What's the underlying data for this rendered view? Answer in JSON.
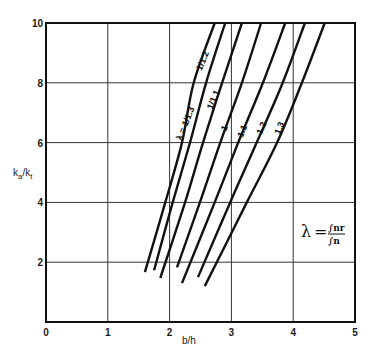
{
  "chart_data": {
    "type": "line",
    "title": "",
    "xlabel": "b/h",
    "ylabel": "k_a/k_t",
    "xlim": [
      0,
      5
    ],
    "ylim": [
      0,
      10
    ],
    "x_ticks": [
      "0",
      "1",
      "2",
      "3",
      "4",
      "5"
    ],
    "y_ticks": [
      "2",
      "4",
      "6",
      "8",
      "10"
    ],
    "grid": true,
    "legend_position": "none (inline curve labels)",
    "annotation": {
      "lambda_symbol": "λ",
      "equals": "=",
      "numerator": "∫nr",
      "denominator": "∫n",
      "text": "λ = ∫nr / ∫n"
    },
    "series": [
      {
        "name": "λ = 1/1.3",
        "label": "λ = 1/1.3",
        "x": [
          1.6,
          1.93,
          2.2,
          2.39,
          2.73
        ],
        "y": [
          1.67,
          4.0,
          6.0,
          8.0,
          10.0
        ]
      },
      {
        "name": "1/1.2",
        "label": "1/1.2",
        "x": [
          1.75,
          2.05,
          2.33,
          2.59,
          2.9
        ],
        "y": [
          1.73,
          4.0,
          6.0,
          8.0,
          10.0
        ]
      },
      {
        "name": "1/1.1",
        "label": "1/1.1",
        "x": [
          1.85,
          2.25,
          2.54,
          2.85,
          3.17
        ],
        "y": [
          1.47,
          4.0,
          6.0,
          8.0,
          10.0
        ]
      },
      {
        "name": "1",
        "label": "1",
        "x": [
          2.12,
          2.49,
          2.82,
          3.17,
          3.48
        ],
        "y": [
          1.83,
          4.0,
          6.0,
          8.0,
          10.0
        ]
      },
      {
        "name": "1.1",
        "label": "1.1",
        "x": [
          2.2,
          2.73,
          3.11,
          3.51,
          3.87
        ],
        "y": [
          1.3,
          4.0,
          6.0,
          8.0,
          10.0
        ]
      },
      {
        "name": "1.2",
        "label": "1.2",
        "x": [
          2.46,
          2.98,
          3.41,
          3.83,
          4.19
        ],
        "y": [
          1.5,
          4.0,
          6.0,
          8.0,
          10.0
        ]
      },
      {
        "name": "1.3",
        "label": "1.3",
        "x": [
          2.57,
          3.25,
          3.74,
          4.14,
          4.51
        ],
        "y": [
          1.2,
          4.0,
          6.0,
          8.0,
          10.0
        ]
      }
    ],
    "label_positions": [
      {
        "series": 0,
        "x": 2.3,
        "y": 6.6
      },
      {
        "series": 1,
        "x": 2.58,
        "y": 8.7
      },
      {
        "series": 2,
        "x": 2.75,
        "y": 7.4
      },
      {
        "series": 3,
        "x": 2.93,
        "y": 6.45
      },
      {
        "series": 4,
        "x": 3.22,
        "y": 6.35
      },
      {
        "series": 5,
        "x": 3.53,
        "y": 6.45
      },
      {
        "series": 6,
        "x": 3.82,
        "y": 6.45
      }
    ]
  },
  "colors": {
    "line": "#111111",
    "grid": "#333333",
    "background": "#ffffff"
  }
}
